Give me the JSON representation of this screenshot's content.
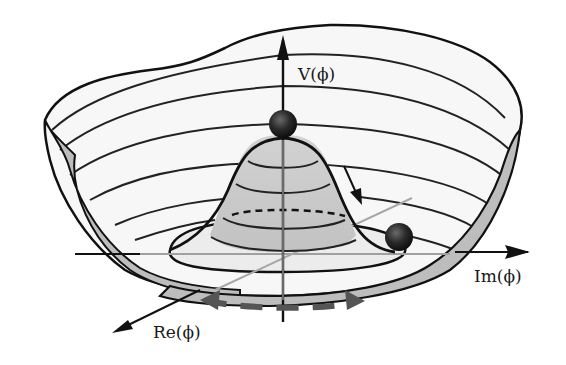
{
  "diagram": {
    "labels": {
      "v_axis": "V(ϕ)",
      "im_axis": "Im(ϕ)",
      "re_axis": "Re(ϕ)"
    },
    "elements": {
      "ball_top": "unstable equilibrium ball at hat peak",
      "ball_bottom": "ball in trough (stable minimum)",
      "arrow_roll": "rolling-down arrow",
      "arrow_circular": "dashed circular-symmetry arrow"
    },
    "colors": {
      "outline": "#111111",
      "surface_inner": "#f6f6f6",
      "hat_fill": "#c8c8c8",
      "rim_fill": "#bdbdbd",
      "ball": "#1e1e1e",
      "dashed_arrow": "#555555",
      "grey_axis": "#a0a0a0"
    }
  }
}
